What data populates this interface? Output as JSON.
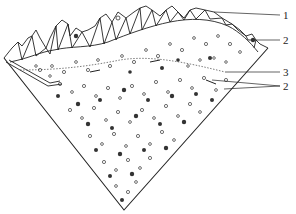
{
  "figure": {
    "colors": {
      "line": "#222222",
      "background": "#ffffff",
      "particle_dark": "#333333"
    },
    "labels": [
      {
        "id": "label-1",
        "text": "1",
        "x": 283,
        "y": 10,
        "leader_from": [
          214,
          12
        ],
        "leader_to": [
          280,
          15
        ]
      },
      {
        "id": "label-2-top",
        "text": "2",
        "x": 283,
        "y": 35,
        "leader_from": [
          256,
          40
        ],
        "leader_to": [
          280,
          40
        ]
      },
      {
        "id": "label-3",
        "text": "3",
        "x": 283,
        "y": 67,
        "leader_from": [
          225,
          72
        ],
        "leader_to": [
          280,
          72
        ]
      },
      {
        "id": "label-2-bottom",
        "text": "2",
        "x": 283,
        "y": 82,
        "leader_from": [
          212,
          80
        ],
        "leader_to": [
          280,
          86
        ]
      }
    ]
  }
}
